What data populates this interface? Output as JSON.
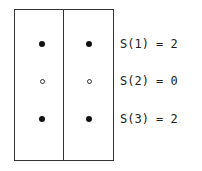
{
  "diagram": {
    "columns": 2,
    "rows": [
      {
        "label": "S(1) = 2",
        "state": "filled"
      },
      {
        "label": "S(2) = 0",
        "state": "hollow"
      },
      {
        "label": "S(3) = 2",
        "state": "filled"
      }
    ]
  }
}
